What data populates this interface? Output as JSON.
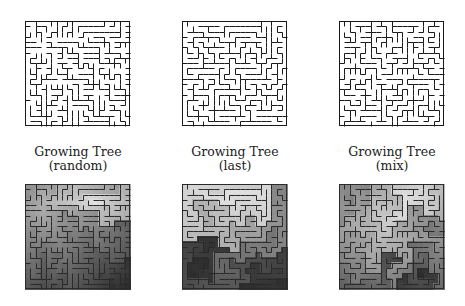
{
  "figure": {
    "columns": [
      {
        "title_line1": "Growing Tree",
        "title_line2": "(random)",
        "strategy": "random",
        "seed": 11,
        "maze_box": {
          "x": 25,
          "y": 21,
          "size": 106
        },
        "heat_box": {
          "x": 25,
          "y": 184,
          "size": 106
        },
        "heat_source": [
          13,
          3
        ]
      },
      {
        "title_line1": "Growing Tree",
        "title_line2": "(last)",
        "strategy": "last",
        "seed": 23,
        "maze_box": {
          "x": 182,
          "y": 21,
          "size": 106
        },
        "heat_box": {
          "x": 182,
          "y": 184,
          "size": 106
        },
        "heat_source": [
          9,
          1
        ]
      },
      {
        "title_line1": "Growing Tree",
        "title_line2": "(mix)",
        "strategy": "mix",
        "seed": 37,
        "maze_box": {
          "x": 339,
          "y": 21,
          "size": 106
        },
        "heat_box": {
          "x": 339,
          "y": 184,
          "size": 106
        },
        "heat_source": [
          12,
          3
        ]
      }
    ],
    "grid_cells": 20,
    "wall_color": "#1a1a1a",
    "heat_wall_color": "#2a2a2a",
    "heatmap_colormap": "grayscale",
    "heat_light": "#e6e6e6",
    "heat_dark": "#2e2e2e"
  }
}
